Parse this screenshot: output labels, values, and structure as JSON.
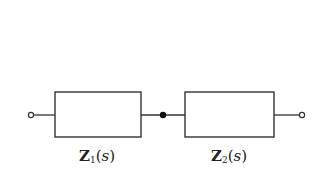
{
  "diagram": {
    "type": "series-impedance-block-diagram",
    "line_color": "#333333",
    "blocks": [
      {
        "id": "Z1",
        "symbol": "Z",
        "subscript": "1",
        "argument": "s",
        "label": "Z1(s)"
      },
      {
        "id": "Z2",
        "symbol": "Z",
        "subscript": "2",
        "argument": "s",
        "label": "Z2(s)"
      }
    ],
    "terminals": [
      {
        "id": "input",
        "style": "open-circle"
      },
      {
        "id": "junction",
        "style": "filled-dot"
      },
      {
        "id": "output",
        "style": "open-circle"
      }
    ],
    "paren_open": "(",
    "paren_close": ")"
  }
}
